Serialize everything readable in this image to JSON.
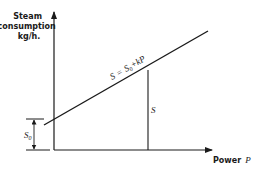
{
  "diagram": {
    "type": "line-graph-schematic",
    "y_axis": {
      "label_lines": [
        "Steam",
        "consumption",
        "kg/h."
      ]
    },
    "x_axis": {
      "label": "Power",
      "label_var": "P"
    },
    "line_equation": "S = S₀ + kP",
    "line_equation_parts": {
      "lhs": "S",
      "eq": "=",
      "s0": "S",
      "s0_sub": "0",
      "rest": "+kP"
    },
    "ordinate_label": "S",
    "intercept_label": "S",
    "intercept_sub": "0",
    "colors": {
      "line": "#1a1a1a",
      "background": "#ffffff"
    }
  }
}
